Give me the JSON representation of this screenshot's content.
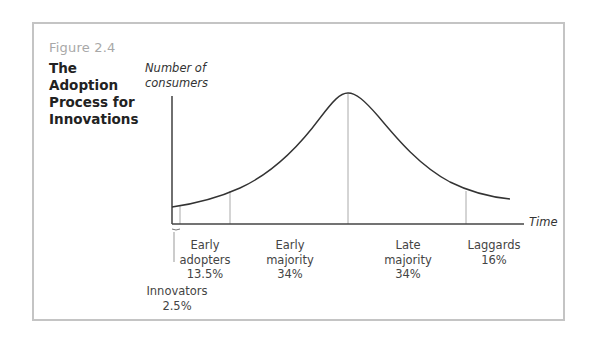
{
  "figure": {
    "number": "Figure 2.4",
    "title_lines": [
      "The Adoption",
      "Process for",
      "Innovations"
    ]
  },
  "axes": {
    "y_label_lines": [
      "Number of",
      "consumers"
    ],
    "x_label": "Time"
  },
  "segments": [
    {
      "name": "Innovators",
      "percent": "2.5%"
    },
    {
      "name": "Early adopters",
      "name_lines": [
        "Early",
        "adopters"
      ],
      "percent": "13.5%"
    },
    {
      "name": "Early majority",
      "name_lines": [
        "Early",
        "majority"
      ],
      "percent": "34%"
    },
    {
      "name": "Late majority",
      "name_lines": [
        "Late",
        "majority"
      ],
      "percent": "34%"
    },
    {
      "name": "Laggards",
      "percent": "16%"
    }
  ],
  "colors": {
    "frame": "#c4c4c4",
    "figure_number": "#a8a8a8",
    "curve": "#333333",
    "divider": "#aaaaaa",
    "axis": "#333333"
  }
}
